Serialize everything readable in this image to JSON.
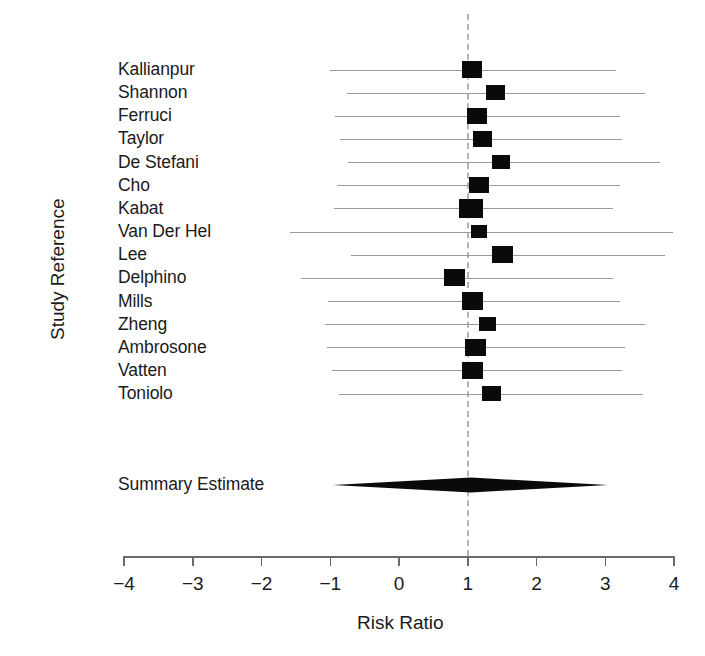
{
  "chart_data": {
    "type": "forest",
    "title": "",
    "xlabel": "Risk Ratio",
    "ylabel": "Study Reference",
    "xlim": [
      -4,
      4
    ],
    "xticks": [
      -4,
      -3,
      -2,
      -1,
      0,
      1,
      2,
      3,
      4
    ],
    "xticklabels": [
      "−4",
      "−3",
      "−2",
      "−1",
      "0",
      "1",
      "2",
      "3",
      "4"
    ],
    "grid": false,
    "reference_line": 1,
    "reference_line_style": "dashed",
    "categories": [
      "Kallianpur",
      "Shannon",
      "Ferruci",
      "Taylor",
      "De Stefani",
      "Cho",
      "Kabat",
      "Van Der Hel",
      "Lee",
      "Delphino",
      "Mills",
      "Zheng",
      "Ambrosone",
      "Vatten",
      "Toniolo"
    ],
    "studies": [
      {
        "label": "Kallianpur",
        "estimate": 1.06,
        "ci_low": -1.0,
        "ci_high": 3.15,
        "box": 20
      },
      {
        "label": "Shannon",
        "estimate": 1.4,
        "ci_low": -0.75,
        "ci_high": 3.58,
        "box": 19
      },
      {
        "label": "Ferruci",
        "estimate": 1.14,
        "ci_low": -0.93,
        "ci_high": 3.21,
        "box": 20
      },
      {
        "label": "Taylor",
        "estimate": 1.21,
        "ci_low": -0.86,
        "ci_high": 3.24,
        "box": 19
      },
      {
        "label": "De Stefani",
        "estimate": 1.48,
        "ci_low": -0.74,
        "ci_high": 3.8,
        "box": 18
      },
      {
        "label": "Cho",
        "estimate": 1.17,
        "ci_low": -0.9,
        "ci_high": 3.21,
        "box": 20
      },
      {
        "label": "Kabat",
        "estimate": 1.04,
        "ci_low": -0.95,
        "ci_high": 3.11,
        "box": 24
      },
      {
        "label": "Van Der Hel",
        "estimate": 1.17,
        "ci_low": -1.58,
        "ci_high": 3.99,
        "box": 16
      },
      {
        "label": "Lee",
        "estimate": 1.51,
        "ci_low": -0.7,
        "ci_high": 3.87,
        "box": 21
      },
      {
        "label": "Delphino",
        "estimate": 0.81,
        "ci_low": -1.43,
        "ci_high": 3.11,
        "box": 21
      },
      {
        "label": "Mills",
        "estimate": 1.07,
        "ci_low": -1.04,
        "ci_high": 3.21,
        "box": 21
      },
      {
        "label": "Zheng",
        "estimate": 1.28,
        "ci_low": -1.08,
        "ci_high": 3.58,
        "box": 17
      },
      {
        "label": "Ambrosone",
        "estimate": 1.11,
        "ci_low": -1.05,
        "ci_high": 3.28,
        "box": 21
      },
      {
        "label": "Vatten",
        "estimate": 1.07,
        "ci_low": -0.98,
        "ci_high": 3.25,
        "box": 21
      },
      {
        "label": "Toniolo",
        "estimate": 1.35,
        "ci_low": -0.88,
        "ci_high": 3.55,
        "box": 19
      }
    ],
    "summary": {
      "label": "Summary Estimate",
      "estimate": 1.05,
      "ci_low": -0.96,
      "ci_high": 3.04
    }
  },
  "axis": {
    "x_title": "Risk Ratio",
    "y_title": "Study Reference"
  }
}
